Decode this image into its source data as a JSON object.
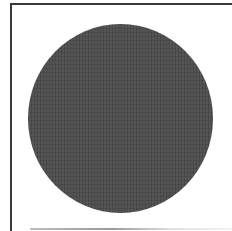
{
  "image": {
    "description": "Dark gray filled circle inside a partially bordered white frame",
    "shape": "circle",
    "fill_color": "#4b4b4b",
    "frame_border_color": "#3a3a3a",
    "background_color": "#ffffff"
  }
}
